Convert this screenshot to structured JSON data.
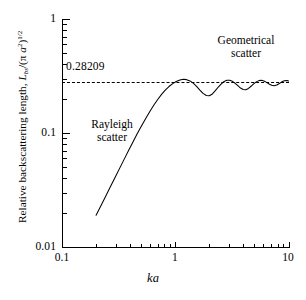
{
  "chart_data": {
    "type": "line",
    "title": "",
    "xlabel": "ka",
    "ylabel": "Relative backscattering length, L_bs/(π a²)^(1/2)",
    "xscale": "log",
    "yscale": "log",
    "xlim": [
      0.1,
      10
    ],
    "ylim": [
      0.01,
      1
    ],
    "xticks": [
      "0.1",
      "1",
      "10"
    ],
    "yticks": [
      "0.01",
      "0.1",
      "1"
    ],
    "grid": false,
    "legend": null,
    "reference_line": {
      "orientation": "horizontal",
      "value": 0.28209,
      "label": "0.28209",
      "style": "dashed"
    },
    "annotations": [
      {
        "text": "Rayleigh scatter",
        "line1": "Rayleigh",
        "line2": "scatter",
        "x": 0.32,
        "y": 0.115
      },
      {
        "text": "Geometrical scatter",
        "line1": "Geometrical",
        "line2": "scatter",
        "x": 5.5,
        "y": 0.6
      },
      {
        "text": "0.28209",
        "x": 0.12,
        "y": 0.33
      }
    ],
    "series": [
      {
        "name": "Relative backscattering length",
        "x": [
          0.2,
          0.22,
          0.24,
          0.26,
          0.28,
          0.3,
          0.33,
          0.36,
          0.39,
          0.42,
          0.46,
          0.5,
          0.55,
          0.6,
          0.65,
          0.7,
          0.76,
          0.82,
          0.88,
          0.95,
          1.02,
          1.1,
          1.18,
          1.26,
          1.35,
          1.45,
          1.55,
          1.65,
          1.76,
          1.88,
          2.0,
          2.13,
          2.26,
          2.4,
          2.55,
          2.7,
          2.86,
          3.02,
          3.2,
          3.38,
          3.57,
          3.77,
          3.98,
          4.2,
          4.43,
          4.67,
          4.92,
          5.19,
          5.47,
          5.76,
          6.07,
          6.4,
          6.74,
          7.1,
          7.48,
          7.88,
          8.3,
          8.74,
          9.2,
          9.69,
          10.0
        ],
        "y": [
          0.019,
          0.0229,
          0.0272,
          0.0319,
          0.0369,
          0.0423,
          0.0512,
          0.0608,
          0.0712,
          0.0822,
          0.0978,
          0.1138,
          0.1348,
          0.156,
          0.1768,
          0.1968,
          0.2192,
          0.239,
          0.2556,
          0.271,
          0.2828,
          0.292,
          0.2958,
          0.2938,
          0.2862,
          0.2724,
          0.2556,
          0.2382,
          0.2227,
          0.2131,
          0.212,
          0.22,
          0.235,
          0.253,
          0.27,
          0.283,
          0.29,
          0.2902,
          0.284,
          0.273,
          0.26,
          0.248,
          0.241,
          0.24,
          0.246,
          0.257,
          0.27,
          0.281,
          0.288,
          0.29,
          0.286,
          0.278,
          0.269,
          0.262,
          0.26,
          0.264,
          0.272,
          0.281,
          0.287,
          0.289,
          0.286
        ]
      }
    ],
    "asymptote_value": 0.28209
  },
  "axes": {
    "y_title": {
      "prefix": "Relative backscattering length, ",
      "symbol": "L",
      "subscript": "bs",
      "divider": "/(",
      "pi": "π ",
      "a": "a",
      "a_exp": "2",
      "close": ")",
      "exponent": "1/2"
    },
    "x_title": "ka",
    "y_tick_labels": [
      "1",
      "0.1",
      "0.01"
    ],
    "x_tick_labels": [
      "0.1",
      "1",
      "10"
    ]
  },
  "annotations": {
    "value_label": "0.28209",
    "rayleigh_line1": "Rayleigh",
    "rayleigh_line2": "scatter",
    "geometrical_line1": "Geometrical",
    "geometrical_line2": "scatter"
  },
  "colors": {
    "axis": "#000000",
    "curve": "#000000",
    "dashed": "#000000",
    "background": "#ffffff"
  }
}
